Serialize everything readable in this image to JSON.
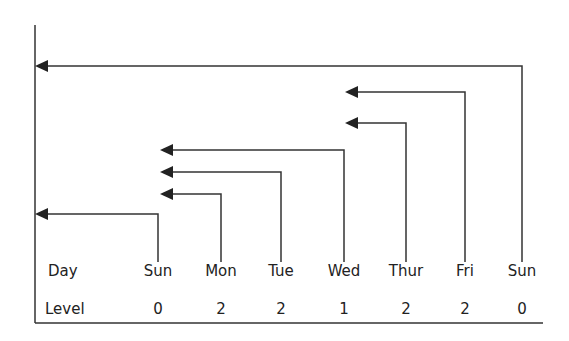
{
  "diagram": {
    "row_labels": {
      "day": "Day",
      "level": "Level"
    },
    "columns": [
      {
        "day": "Sun",
        "level": "0",
        "x": 158
      },
      {
        "day": "Mon",
        "level": "2",
        "x": 221
      },
      {
        "day": "Tue",
        "level": "2",
        "x": 281
      },
      {
        "day": "Wed",
        "level": "1",
        "x": 344
      },
      {
        "day": "Thur",
        "level": "2",
        "x": 406
      },
      {
        "day": "Fri",
        "level": "2",
        "x": 465
      },
      {
        "day": "Sun",
        "level": "0",
        "x": 522
      }
    ],
    "arrows": [
      {
        "from": "Sun",
        "to_x": 35,
        "y": 214
      },
      {
        "from": "Mon",
        "to_x": 160,
        "y": 194
      },
      {
        "from": "Tue",
        "to_x": 160,
        "y": 172
      },
      {
        "from": "Wed",
        "to_x": 160,
        "y": 150
      },
      {
        "from": "Thur",
        "to_x": 345,
        "y": 123
      },
      {
        "from": "Fri",
        "to_x": 345,
        "y": 92
      },
      {
        "from": "Sun",
        "to_x": 35,
        "y": 66
      }
    ],
    "line_color": "#333333"
  }
}
